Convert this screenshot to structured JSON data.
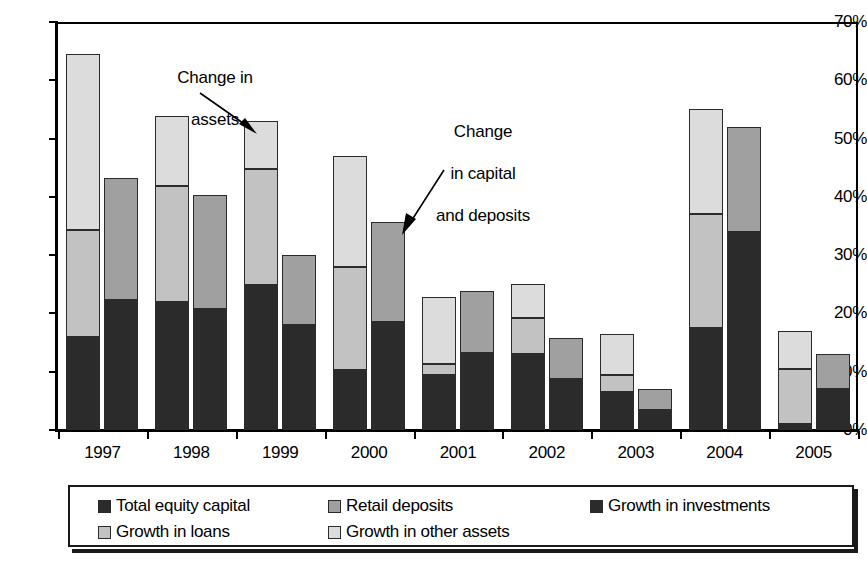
{
  "chart_data": {
    "type": "bar",
    "subtype": "grouped-stacked",
    "title": "",
    "xlabel": "",
    "ylabel": "",
    "ylim": [
      0,
      70
    ],
    "ytick_labels": [
      "0%",
      "10%",
      "20%",
      "30%",
      "40%",
      "50%",
      "60%",
      "70%"
    ],
    "ytick_values": [
      0,
      10,
      20,
      30,
      40,
      50,
      60,
      70
    ],
    "grid": false,
    "legend_position": "bottom",
    "categories": [
      "1997",
      "1998",
      "1999",
      "2000",
      "2001",
      "2002",
      "2003",
      "2004",
      "2005"
    ],
    "groups": [
      {
        "name": "Change in assets",
        "bar_position": "left",
        "series": [
          {
            "name": "Growth in investments",
            "color": "#2b2b2b",
            "values": [
              16.0,
              22.0,
              24.8,
              10.3,
              9.5,
              13.0,
              6.5,
              17.5,
              1.0
            ]
          },
          {
            "name": "Growth in loans",
            "color": "#c2c2c2",
            "values": [
              18.3,
              19.8,
              20.0,
              17.7,
              1.8,
              6.3,
              3.0,
              19.5,
              9.5
            ]
          },
          {
            "name": "Growth in other assets",
            "color": "#dcdcdc",
            "values": [
              30.2,
              12.0,
              8.2,
              19.0,
              11.5,
              5.7,
              7.0,
              18.0,
              6.5
            ]
          }
        ]
      },
      {
        "name": "Change in capital and deposits",
        "bar_position": "right",
        "series": [
          {
            "name": "Total equity capital",
            "color": "#2b2b2b",
            "values": [
              22.3,
              20.7,
              18.0,
              18.5,
              13.2,
              8.7,
              3.5,
              34.0,
              7.0
            ]
          },
          {
            "name": "Retail deposits",
            "color": "#a0a0a0",
            "values": [
              21.0,
              19.6,
              12.0,
              17.2,
              10.6,
              7.1,
              3.6,
              18.0,
              6.0
            ]
          }
        ]
      }
    ],
    "bar_totals": {
      "assets": [
        64.5,
        53.8,
        53.0,
        47.0,
        22.8,
        25.0,
        16.5,
        55.0,
        17.0
      ],
      "capital_deposits": [
        43.3,
        40.3,
        30.0,
        35.7,
        23.8,
        15.8,
        7.1,
        52.0,
        13.0
      ]
    },
    "annotations": [
      {
        "id": "change-in-assets",
        "text": "Change in\nassets",
        "target": "1999 assets bar"
      },
      {
        "id": "change-in-capital-and-deposits",
        "text": "Change\nin capital\nand deposits",
        "target": "2000 capital and deposits bar"
      }
    ],
    "legend": [
      {
        "label": "Total equity capital",
        "color": "#2b2b2b",
        "swatch": "dark"
      },
      {
        "label": "Retail deposits",
        "color": "#a0a0a0",
        "swatch": "medium"
      },
      {
        "label": "Growth in investments",
        "color": "#2b2b2b",
        "swatch": "dark"
      },
      {
        "label": "Growth in loans",
        "color": "#c2c2c2",
        "swatch": "light"
      },
      {
        "label": "Growth in other assets",
        "color": "#dcdcdc",
        "swatch": "lightest"
      }
    ]
  },
  "annotation_texts": {
    "assets_line1": "Change in",
    "assets_line2": "assets",
    "capital_line1": "Change",
    "capital_line2": "in capital",
    "capital_line3": "and deposits"
  }
}
